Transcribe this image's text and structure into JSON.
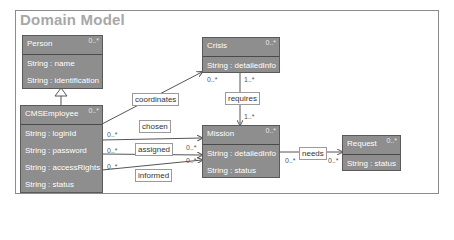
{
  "diagram": {
    "title": "Domain Model",
    "classes": [
      {
        "id": "person",
        "name": "Person",
        "multiplicity": "0..*",
        "attributes": [
          "String : name",
          "String : identification"
        ]
      },
      {
        "id": "cmsemployee",
        "name": "CMSEmployee",
        "multiplicity": "0..*",
        "attributes": [
          "String : loginId",
          "String : password",
          "String : accessRights",
          "String : status"
        ]
      },
      {
        "id": "crisis",
        "name": "Crisis",
        "multiplicity": "0..*",
        "attributes": [
          "String : detailedInfo"
        ]
      },
      {
        "id": "mission",
        "name": "Mission",
        "multiplicity": "0..*",
        "attributes": [
          "String : detailedInfo",
          "String : status"
        ]
      },
      {
        "id": "request",
        "name": "Request",
        "multiplicity": "0..*",
        "attributes": [
          "String : status"
        ]
      }
    ],
    "associations": [
      {
        "name": "coordinates",
        "from": "CMSEmployee",
        "to": "Crisis",
        "target_multiplicity": "0..*"
      },
      {
        "name": "requires",
        "from": "Crisis",
        "to": "Mission",
        "source_multiplicity": "1..*",
        "target_multiplicity": "1..*"
      },
      {
        "name": "chosen",
        "from": "CMSEmployee",
        "to": "Mission",
        "source_multiplicity": "0..*"
      },
      {
        "name": "assigned",
        "from": "CMSEmployee",
        "to": "Mission",
        "source_multiplicity": "0..*",
        "target_multiplicity": "0..*"
      },
      {
        "name": "informed",
        "from": "CMSEmployee",
        "to": "Mission",
        "source_multiplicity": "0..*",
        "target_multiplicity": "0..*"
      },
      {
        "name": "needs",
        "from": "Mission",
        "to": "Request",
        "source_multiplicity": "0..*",
        "target_multiplicity": "0..*"
      }
    ],
    "generalizations": [
      {
        "child": "CMSEmployee",
        "parent": "Person"
      }
    ],
    "colors": {
      "class_fill": "#8e8e8e",
      "class_border": "#5a5a5a",
      "title": "#a8a8a8",
      "edge": "#555555"
    }
  }
}
